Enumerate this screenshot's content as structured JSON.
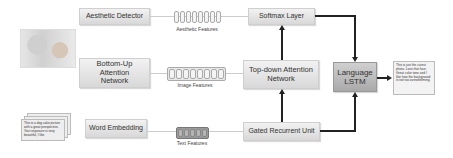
{
  "diagram": {
    "input_image": {
      "description": "photo of a baby"
    },
    "input_text": {
      "text": "This is a dog cake picture with a great perspective. Your exposure is very beautiful, I like"
    },
    "modules": {
      "aesthetic_detector": "Aesthetic Detector",
      "bottom_up": "Bottom-Up Attention Network",
      "word_embedding": "Word Embedding",
      "softmax": "Softmax Layer",
      "top_down": "Top-down Attention Network",
      "gru": "Gated Recurrent Unit",
      "lstm": "Language LSTM"
    },
    "features": {
      "aesthetic": "Aesthetic Features",
      "image": "Image Features",
      "text": "Text Features"
    },
    "output_text": "This is just the cutest photo. Love that face. Great color tone and I like how the background is not too overwhelming."
  }
}
